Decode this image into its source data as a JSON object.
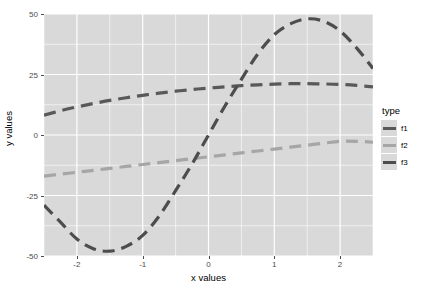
{
  "chart_data": {
    "type": "line",
    "title": "",
    "xlabel": "x values",
    "ylabel": "y values",
    "xlim": [
      -2.5,
      2.5
    ],
    "ylim": [
      -50,
      50
    ],
    "x_ticks": [
      -2,
      -1,
      0,
      1,
      2
    ],
    "x_tick_labels": [
      "-2",
      "-1",
      "0",
      "1",
      "2"
    ],
    "y_ticks": [
      -50,
      -25,
      0,
      25,
      50
    ],
    "y_tick_labels": [
      "-50",
      "-25",
      "0",
      "25",
      "50"
    ],
    "grid": true,
    "grid_color": "#ffffff",
    "panel_background": "#d9d9d9",
    "legend_position": "right",
    "legend_title": "type",
    "line_style": "dashed",
    "series": [
      {
        "name": "f1",
        "color": "#595959",
        "x": [
          -2.5,
          -2.25,
          -2.0,
          -1.75,
          -1.5,
          -1.25,
          -1.0,
          -0.75,
          -0.5,
          -0.25,
          0.0,
          0.25,
          0.5,
          0.75,
          1.0,
          1.25,
          1.5,
          1.75,
          2.0,
          2.25,
          2.5
        ],
        "values": [
          8.2,
          10.0,
          11.6,
          13.0,
          14.3,
          15.4,
          16.4,
          17.3,
          18.1,
          18.8,
          19.4,
          19.9,
          20.4,
          20.7,
          21.0,
          21.2,
          21.2,
          21.1,
          20.9,
          20.5,
          19.9
        ]
      },
      {
        "name": "f2",
        "color": "#a6a6a6",
        "x": [
          -2.5,
          -2.25,
          -2.0,
          -1.75,
          -1.5,
          -1.25,
          -1.0,
          -0.75,
          -0.5,
          -0.25,
          0.0,
          0.25,
          0.5,
          0.75,
          1.0,
          1.25,
          1.5,
          1.75,
          2.0,
          2.25,
          2.5
        ],
        "values": [
          -17.0,
          -16.2,
          -15.4,
          -14.6,
          -13.8,
          -13.0,
          -12.2,
          -11.4,
          -10.6,
          -9.8,
          -9.0,
          -8.2,
          -7.4,
          -6.6,
          -5.8,
          -5.0,
          -4.2,
          -3.4,
          -2.6,
          -2.6,
          -3.0
        ]
      },
      {
        "name": "f3",
        "color": "#4d4d4d",
        "x": [
          -2.5,
          -2.25,
          -2.0,
          -1.75,
          -1.5,
          -1.25,
          -1.0,
          -0.75,
          -0.5,
          -0.25,
          0.0,
          0.25,
          0.5,
          0.75,
          1.0,
          1.25,
          1.5,
          1.75,
          2.0,
          2.25,
          2.5
        ],
        "values": [
          -29.0,
          -36.0,
          -43.0,
          -47.0,
          -48.0,
          -46.0,
          -41.5,
          -33.5,
          -23.0,
          -12.0,
          0.0,
          12.0,
          23.0,
          33.5,
          41.5,
          46.0,
          48.0,
          47.0,
          43.0,
          36.0,
          27.5
        ]
      }
    ]
  },
  "legend": {
    "title": "type",
    "items": [
      {
        "label": "f1",
        "color": "#595959"
      },
      {
        "label": "f2",
        "color": "#a6a6a6"
      },
      {
        "label": "f3",
        "color": "#4d4d4d"
      }
    ]
  },
  "axes": {
    "x_title": "x values",
    "y_title": "y values"
  }
}
